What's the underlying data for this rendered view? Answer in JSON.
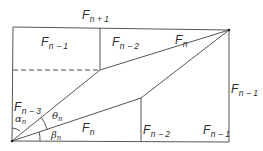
{
  "figure": {
    "type": "fibonacci-rectangle-parallelogram-dissection",
    "colors": {
      "stroke": "#555555",
      "text": "#2a2a2a",
      "background": "#ffffff"
    }
  },
  "labels": {
    "top": {
      "base": "F",
      "sub": "n + 1"
    },
    "top_left_cell": {
      "base": "F",
      "sub": "n − 1"
    },
    "top_mid_cell": {
      "base": "F",
      "sub": "n − 2"
    },
    "top_diagonal": {
      "base": "F",
      "sub": "n"
    },
    "right_side": {
      "base": "F",
      "sub": "n − 1"
    },
    "left_side": {
      "base": "F",
      "sub": "n − 3"
    },
    "lower_diagonal": {
      "base": "F",
      "sub": "n"
    },
    "bottom_mid_cell": {
      "base": "F",
      "sub": "n − 2"
    },
    "bottom_right_cell": {
      "base": "F",
      "sub": "n − 1"
    }
  },
  "angles": {
    "alpha": {
      "symbol": "α",
      "sub": "n"
    },
    "theta": {
      "symbol": "θ",
      "sub": "n"
    },
    "beta": {
      "symbol": "β",
      "sub": "n"
    }
  }
}
